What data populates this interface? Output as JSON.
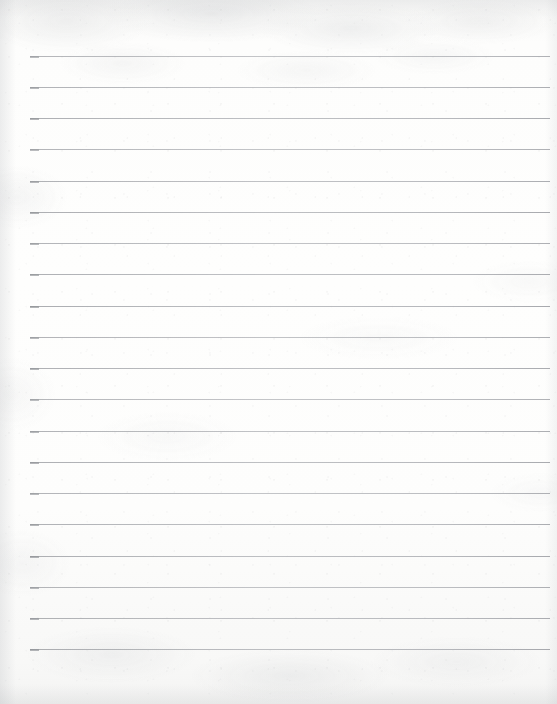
{
  "document": {
    "kind": "scanned-lined-notebook-page",
    "title": "Blank lined paper",
    "content_text": "",
    "has_handwriting": false,
    "has_printed_text": false
  },
  "canvas": {
    "width": 557,
    "height": 704,
    "paper_color": "#fcfcfb",
    "paper_tint_top": "#f7f7f6",
    "paper_tint_bottom": "#f4f4f3"
  },
  "ruling": {
    "line_color": "#b0b2b6",
    "line_cap_color": "#929499",
    "line_thickness_px": 1,
    "line_count": 20,
    "left_x": 30,
    "right_x": 550,
    "line_length_px": 520,
    "first_line_y": 56,
    "spacing_px": 31.2,
    "last_line_y": 649,
    "margins": {
      "top_px": 56,
      "bottom_px": 55,
      "left_px": 30,
      "right_px": 7
    },
    "line_y_positions": [
      56,
      87,
      118,
      149,
      181,
      212,
      243,
      274,
      306,
      337,
      368,
      399,
      431,
      462,
      493,
      524,
      556,
      587,
      618,
      649
    ]
  }
}
